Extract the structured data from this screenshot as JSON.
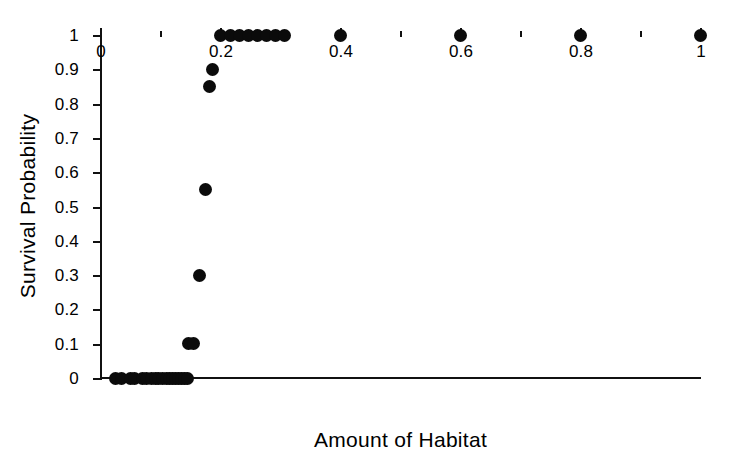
{
  "chart_data": {
    "type": "scatter",
    "title": "",
    "xlabel": "Amount of Habitat",
    "ylabel": "Survival Probability",
    "xlim": [
      0,
      1
    ],
    "ylim": [
      0,
      1
    ],
    "grid": false,
    "legend": null,
    "x_ticks": [
      0,
      0.2,
      0.4,
      0.6,
      0.8,
      1
    ],
    "x_tick_labels": [
      "0",
      "0.2",
      "0.4",
      "0.6",
      "0.8",
      "1"
    ],
    "x_minor_ticks": [
      0.1,
      0.3,
      0.5,
      0.7,
      0.9
    ],
    "y_ticks": [
      0,
      0.1,
      0.2,
      0.3,
      0.4,
      0.5,
      0.6,
      0.7,
      0.8,
      0.9,
      1
    ],
    "y_tick_labels": [
      "0",
      "0.1",
      "0.2",
      "0.3",
      "0.4",
      "0.5",
      "0.6",
      "0.7",
      "0.8",
      "0.9",
      "1"
    ],
    "marker": "filled-circle",
    "marker_color": "#0b0b0b",
    "marker_size": 13,
    "points": [
      {
        "x": 0.025,
        "y": 0
      },
      {
        "x": 0.035,
        "y": 0
      },
      {
        "x": 0.05,
        "y": 0
      },
      {
        "x": 0.058,
        "y": 0
      },
      {
        "x": 0.07,
        "y": 0
      },
      {
        "x": 0.078,
        "y": 0
      },
      {
        "x": 0.085,
        "y": 0
      },
      {
        "x": 0.092,
        "y": 0
      },
      {
        "x": 0.098,
        "y": 0
      },
      {
        "x": 0.104,
        "y": 0
      },
      {
        "x": 0.11,
        "y": 0
      },
      {
        "x": 0.116,
        "y": 0
      },
      {
        "x": 0.121,
        "y": 0
      },
      {
        "x": 0.126,
        "y": 0
      },
      {
        "x": 0.131,
        "y": 0
      },
      {
        "x": 0.136,
        "y": 0
      },
      {
        "x": 0.141,
        "y": 0
      },
      {
        "x": 0.146,
        "y": 0
      },
      {
        "x": 0.148,
        "y": 0.1
      },
      {
        "x": 0.156,
        "y": 0.1
      },
      {
        "x": 0.165,
        "y": 0.3
      },
      {
        "x": 0.175,
        "y": 0.55
      },
      {
        "x": 0.182,
        "y": 0.85
      },
      {
        "x": 0.188,
        "y": 0.9
      },
      {
        "x": 0.2,
        "y": 1
      },
      {
        "x": 0.218,
        "y": 1
      },
      {
        "x": 0.233,
        "y": 1
      },
      {
        "x": 0.248,
        "y": 1
      },
      {
        "x": 0.263,
        "y": 1
      },
      {
        "x": 0.278,
        "y": 1
      },
      {
        "x": 0.293,
        "y": 1
      },
      {
        "x": 0.308,
        "y": 1
      },
      {
        "x": 0.4,
        "y": 1
      },
      {
        "x": 0.6,
        "y": 1
      },
      {
        "x": 0.8,
        "y": 1
      },
      {
        "x": 1.0,
        "y": 1
      }
    ]
  }
}
